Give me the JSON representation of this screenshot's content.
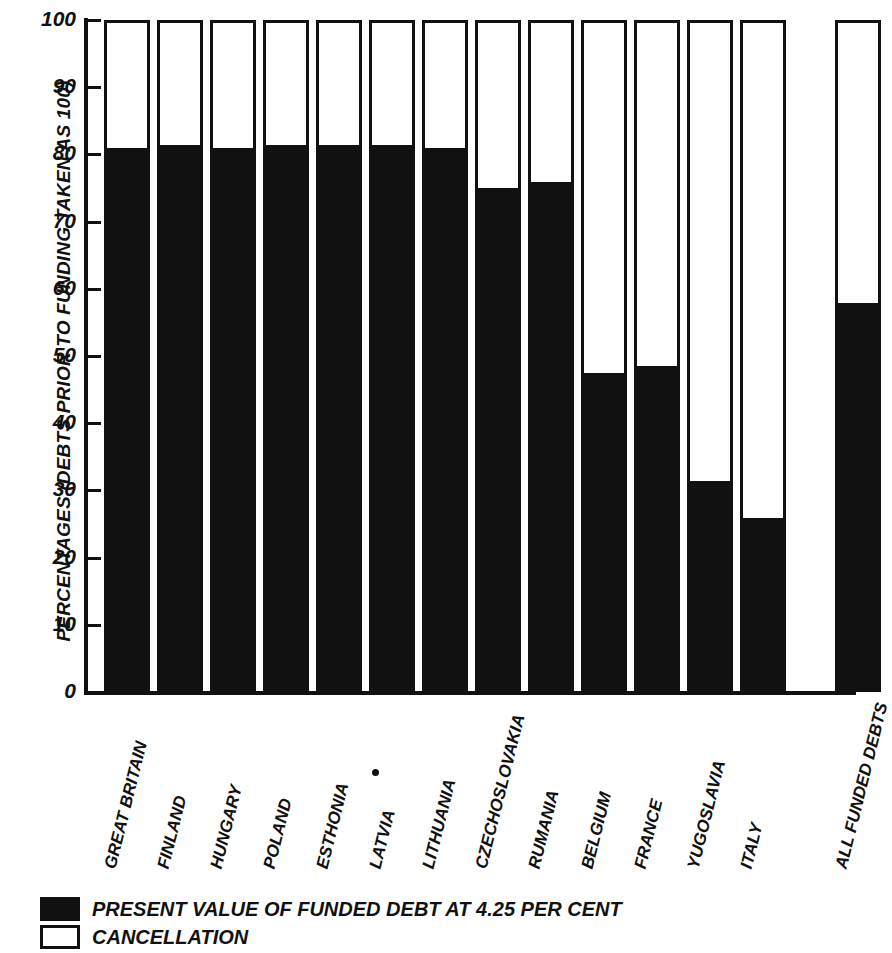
{
  "chart_data": {
    "type": "bar",
    "title": "",
    "subtitle": "",
    "xlabel": "",
    "ylabel": "PERCENTAGES (DEBTS PRIOR TO FUNDING TAKEN AS 100)",
    "ylim": [
      0,
      100
    ],
    "grid": false,
    "legend_position": "bottom-left",
    "stacked": true,
    "categories": [
      "GREAT BRITAIN",
      "FINLAND",
      "HUNGARY",
      "POLAND",
      "ESTHONIA",
      "LATVIA",
      "LITHUANIA",
      "CZECHOSLOVAKIA",
      "RUMANIA",
      "BELGIUM",
      "FRANCE",
      "YUGOSLAVIA",
      "ITALY",
      "ALL FUNDED DEBTS"
    ],
    "series": [
      {
        "name": "PRESENT VALUE OF FUNDED DEBT AT 4.25 PER CENT",
        "color": "#111111",
        "values": [
          80.5,
          81,
          80.5,
          81,
          81,
          81,
          80.5,
          74.5,
          75.5,
          47,
          48,
          31,
          25.5,
          57.5
        ]
      },
      {
        "name": "CANCELLATION",
        "color": "#ffffff",
        "values": [
          19.5,
          19,
          19.5,
          19,
          19,
          19,
          19.5,
          25.5,
          24.5,
          53,
          52,
          69,
          74.5,
          42.5
        ]
      }
    ],
    "y_ticks": [
      0,
      10,
      20,
      30,
      40,
      50,
      60,
      70,
      80,
      90,
      100
    ],
    "y_tick_labels": [
      "0",
      "10",
      "20",
      "30",
      "40",
      "50",
      "60",
      "70",
      "80",
      "90",
      "100"
    ]
  },
  "legend": {
    "items": [
      {
        "label": "PRESENT VALUE OF FUNDED DEBT AT 4.25 PER CENT",
        "swatch": "filled"
      },
      {
        "label": "CANCELLATION",
        "swatch": "hollow"
      }
    ]
  }
}
